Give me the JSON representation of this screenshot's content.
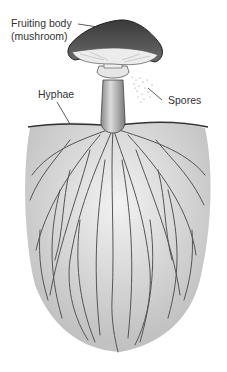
{
  "diagram": {
    "labels": {
      "fruiting_body_line1": "Fruiting body",
      "fruiting_body_line2": "(mushroom)",
      "hyphae": "Hyphae",
      "spores": "Spores"
    },
    "parts": [
      "cap",
      "gills",
      "ring",
      "stipe",
      "soil-line",
      "mycelium-hyphae",
      "spore-cloud"
    ],
    "colors": {
      "cap": "#4a4a4a",
      "gills": "#e8e8e8",
      "stipe": "#bdbdbd",
      "hyphae": "#555555",
      "mycelium_fill": "#d6d6d6",
      "label_text": "#333333"
    }
  }
}
